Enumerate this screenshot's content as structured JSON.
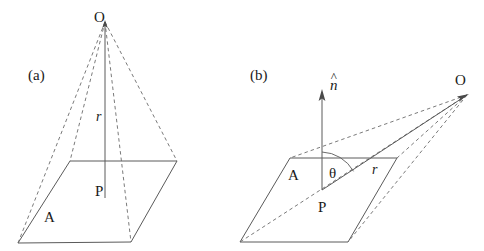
{
  "figure": {
    "background_color": "#ffffff",
    "line_color": "#555555",
    "text_color": "#1a1a1a",
    "width": 484,
    "height": 251,
    "panels": [
      {
        "id": "a",
        "caption": "(a)",
        "caption_pos": {
          "x": 28,
          "y": 68
        },
        "description": "Pyramid: apex O above a planar quadrilateral area A, with r the perpendicular distance from O to the plane meeting it at P.",
        "labels": {
          "apex": "O",
          "foot": "P",
          "distance": "r",
          "area": "A"
        },
        "label_positions": {
          "apex": {
            "x": 94,
            "y": 10
          },
          "foot": {
            "x": 95,
            "y": 184
          },
          "distance": {
            "x": 96,
            "y": 110
          },
          "area": {
            "x": 44,
            "y": 210
          }
        },
        "geometry": {
          "apex_point": {
            "x": 105,
            "y": 22
          },
          "foot_point": {
            "x": 105,
            "y": 198
          },
          "base_corners": [
            {
              "name": "back-left",
              "x": 70,
              "y": 161
            },
            {
              "name": "back-right",
              "x": 177,
              "y": 161
            },
            {
              "name": "front-right",
              "x": 131,
              "y": 242
            },
            {
              "name": "front-left",
              "x": 18,
              "y": 243
            }
          ]
        }
      },
      {
        "id": "b",
        "caption": "(b)",
        "caption_pos": {
          "x": 250,
          "y": 68
        },
        "description": "Tilted planar area A with unit normal n-hat at P; r is the slanted line from P to the off-axis apex O, making angle theta with n-hat.",
        "labels": {
          "apex": "O",
          "foot": "P",
          "distance": "r",
          "area": "A",
          "angle": "θ",
          "normal": "n",
          "normal_accent": "^"
        },
        "label_positions": {
          "apex": {
            "x": 455,
            "y": 73
          },
          "foot": {
            "x": 318,
            "y": 200
          },
          "distance": {
            "x": 372,
            "y": 163
          },
          "area": {
            "x": 288,
            "y": 168
          },
          "angle": {
            "x": 329,
            "y": 166
          },
          "normal": {
            "x": 330,
            "y": 78
          }
        },
        "geometry": {
          "apex_point": {
            "x": 467,
            "y": 95
          },
          "foot_point": {
            "x": 322,
            "y": 190
          },
          "normal_tip": {
            "x": 322,
            "y": 92
          },
          "plane_corners": [
            {
              "name": "top-left",
              "x": 290,
              "y": 158
            },
            {
              "name": "top-right",
              "x": 397,
              "y": 158
            },
            {
              "name": "bottom-right",
              "x": 348,
              "y": 242
            },
            {
              "name": "bottom-left",
              "x": 240,
              "y": 242
            }
          ]
        }
      }
    ]
  }
}
